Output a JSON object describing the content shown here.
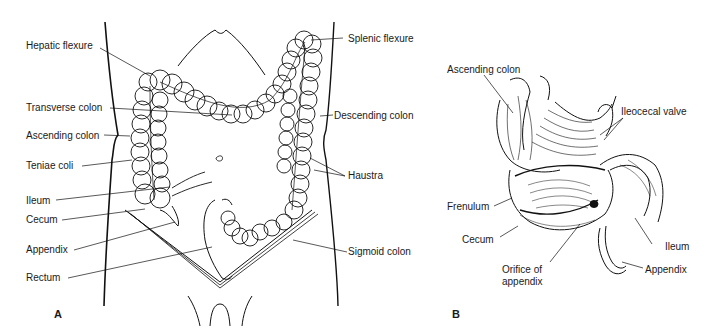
{
  "figure": {
    "panel_a": {
      "letter": "A",
      "labels": {
        "hepatic_flexure": "Hepatic flexure",
        "splenic_flexure": "Splenic flexure",
        "transverse_colon": "Transverse colon",
        "descending_colon": "Descending colon",
        "ascending_colon": "Ascending colon",
        "teniae_coli": "Teniae coli",
        "haustra": "Haustra",
        "ileum": "Ileum",
        "cecum": "Cecum",
        "appendix": "Appendix",
        "sigmoid_colon": "Sigmoid colon",
        "rectum": "Rectum"
      }
    },
    "panel_b": {
      "letter": "B",
      "labels": {
        "ascending_colon": "Ascending colon",
        "ileocecal_valve": "Ileocecal valve",
        "frenulum": "Frenulum",
        "cecum": "Cecum",
        "ileum": "Ileum",
        "orifice_line1": "Orifice of",
        "orifice_line2": "appendix",
        "appendix": "Appendix"
      }
    }
  }
}
